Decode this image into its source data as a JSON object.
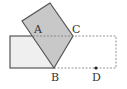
{
  "figure": {
    "labels": {
      "A": "A",
      "B": "B",
      "C": "C",
      "D": "D"
    },
    "colors": {
      "square_fill": "#c8c8c8",
      "rect_fill": "#efefef",
      "stroke": "#555555",
      "dashed": "#888888",
      "background": "#ffffff"
    }
  }
}
